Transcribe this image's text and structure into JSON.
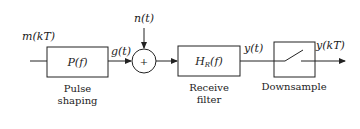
{
  "diagram": {
    "input_signal": "m(kT)",
    "noise_signal": "n(t)",
    "blocks": [
      {
        "id": "pulse-shaping",
        "symbol": "P(f)",
        "caption_line1": "Pulse",
        "caption_line2": "shaping"
      },
      {
        "id": "adder",
        "symbol": "+"
      },
      {
        "id": "receive-filter",
        "symbol_main": "H",
        "symbol_sub": "R",
        "symbol_rest": "(f)",
        "caption_line1": "Receive",
        "caption_line2": "filter"
      },
      {
        "id": "downsample",
        "caption_line1": "Downsample"
      }
    ],
    "signals": {
      "after_pulse": "g(t)",
      "after_filter": "y(t)",
      "output": "y(kT)"
    }
  }
}
